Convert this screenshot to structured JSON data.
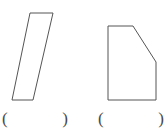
{
  "worksheet": {
    "stroke_color": "#555555",
    "background_color": "#ffffff",
    "text_color": "#4a4a4a"
  },
  "figures": [
    {
      "id": "figure-1",
      "name": "slanted-quadrilateral",
      "shape_type": "quadrilateral",
      "description": "Slanted four-sided figure with horizontal top and bottom edges leaning left",
      "points": "30,13 53,13 33,100 12,100",
      "vertices": [
        {
          "x": 30,
          "y": 13
        },
        {
          "x": 53,
          "y": 13
        },
        {
          "x": 33,
          "y": 100
        },
        {
          "x": 12,
          "y": 100
        }
      ],
      "side_count": 4
    },
    {
      "id": "figure-2",
      "name": "beveled-pentagon",
      "shape_type": "pentagon",
      "description": "Five-sided figure, rectangle with cut-off top-right corner",
      "points": "108,26 133,26 156,62 156,100 108,100",
      "vertices": [
        {
          "x": 108,
          "y": 26
        },
        {
          "x": 133,
          "y": 26
        },
        {
          "x": 156,
          "y": 62
        },
        {
          "x": 156,
          "y": 100
        },
        {
          "x": 108,
          "y": 100
        }
      ],
      "side_count": 5
    }
  ],
  "answers": [
    {
      "id": "answer-1",
      "for_figure": "figure-1",
      "open_paren": "(",
      "close_paren": ")",
      "value": "",
      "placeholder": ""
    },
    {
      "id": "answer-2",
      "for_figure": "figure-2",
      "open_paren": "(",
      "close_paren": ")",
      "value": "",
      "placeholder": ""
    }
  ]
}
